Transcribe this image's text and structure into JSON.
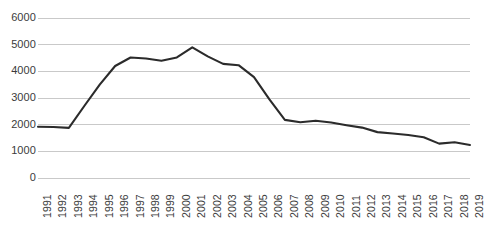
{
  "chart_data": {
    "type": "line",
    "title": "",
    "xlabel": "",
    "ylabel": "",
    "grid": true,
    "legend": false,
    "ylim": [
      0,
      6000
    ],
    "ytick_labels": [
      "6000",
      "5000",
      "4000",
      "3000",
      "2000",
      "1000",
      "0"
    ],
    "ytick_values": [
      6000,
      5000,
      4000,
      3000,
      2000,
      1000,
      0
    ],
    "categories": [
      "1991",
      "1992",
      "1993",
      "1994",
      "1995",
      "1996",
      "1997",
      "1998",
      "1999",
      "2000",
      "2001",
      "2002",
      "2003",
      "2004",
      "2005",
      "2006",
      "2007",
      "2008",
      "2009",
      "2010",
      "2011",
      "2012",
      "2013",
      "2014",
      "2015",
      "2016",
      "2017",
      "2018",
      "2019"
    ],
    "values": [
      1920,
      1910,
      1880,
      2700,
      3500,
      4200,
      4520,
      4480,
      4400,
      4520,
      4900,
      4560,
      4280,
      4230,
      3780,
      2950,
      2180,
      2090,
      2150,
      2080,
      1980,
      1890,
      1720,
      1670,
      1610,
      1530,
      1290,
      1340,
      1240
    ],
    "series": [
      {
        "name": "series-1",
        "color": "#2b2b2b",
        "values": [
          1920,
          1910,
          1880,
          2700,
          3500,
          4200,
          4520,
          4480,
          4400,
          4520,
          4900,
          4560,
          4280,
          4230,
          3780,
          2950,
          2180,
          2090,
          2150,
          2080,
          1980,
          1890,
          1720,
          1670,
          1610,
          1530,
          1290,
          1340,
          1240
        ]
      }
    ],
    "colors": {
      "line": "#2b2b2b",
      "grid": "#c9c9c9",
      "text": "#3b3b3b",
      "background": "#ffffff"
    }
  }
}
